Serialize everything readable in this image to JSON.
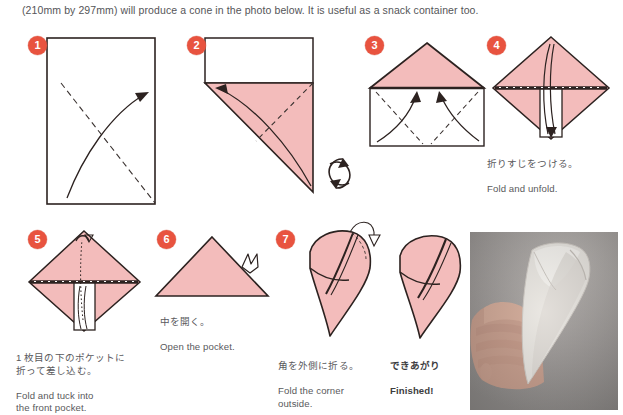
{
  "intro": {
    "text": "(210mm by 297mm) will produce a cone in the photo below.  It is useful as a snack container too."
  },
  "colors": {
    "paper_pink": "#f3bcbb",
    "paper_pink_shade": "#eaa9a8",
    "badge_red": "#e8533f",
    "line_dark": "#2c2220",
    "text_gray": "#59595c",
    "photo_bg": "#a9a5a3"
  },
  "steps": [
    {
      "number": "1",
      "name": "step-1",
      "caption_jp": "",
      "caption_en": "",
      "icons": [
        "valley-fold-dashed-line",
        "curved-fold-arrow"
      ],
      "description": "white rectangle, dashed diagonal crease, curved arrow folding corner up"
    },
    {
      "number": "2",
      "name": "step-2",
      "caption_jp": "",
      "caption_en": "",
      "icons": [
        "valley-fold-dashed-line",
        "curved-fold-arrow",
        "rotate-icon"
      ],
      "description": "pink triangle under white strip, curved arrow, rotate symbol"
    },
    {
      "number": "3",
      "name": "step-3",
      "caption_jp": "",
      "caption_en": "",
      "icons": [
        "valley-fold-dashed-line",
        "curved-fold-arrow"
      ],
      "description": "pink triangle above white rectangle with two dashed creases and two arrows"
    },
    {
      "number": "4",
      "name": "step-4",
      "caption_jp": "折りすじをつける。",
      "caption_en": "Fold and unfold.",
      "icons": [
        "fold-unfold-arrow"
      ],
      "description": "pink diamond with white vertical strip, fold and unfold arrow"
    },
    {
      "number": "5",
      "name": "step-5",
      "caption_jp": "1 枚目の下のポケットに\n折って差し込む。",
      "caption_en": "Fold and tuck into\nthe front pocket.",
      "icons": [
        "tuck-dotted-arrow"
      ],
      "description": "pink diamond with white strip and dotted hidden tuck arrow"
    },
    {
      "number": "6",
      "name": "step-6",
      "caption_jp": "中を開く。",
      "caption_en": "Open the pocket.",
      "icons": [
        "open-pocket-arrow"
      ],
      "description": "pink triangle with open-pocket arrow at upper right"
    },
    {
      "number": "7",
      "name": "step-7",
      "caption_jp": "角を外側に折る。",
      "caption_en": "Fold the corner\noutside.",
      "icons": [
        "fold-over-arrow"
      ],
      "description": "pink cone with corner fold arrow"
    }
  ],
  "finished": {
    "name": "finished-figure",
    "caption_jp": "できあがり",
    "caption_en": "Finished!",
    "description": "completed pink paper cone"
  },
  "photo": {
    "name": "result-photo",
    "alt": "hand holding a white paper cone",
    "background_color": "#a9a5a3"
  }
}
